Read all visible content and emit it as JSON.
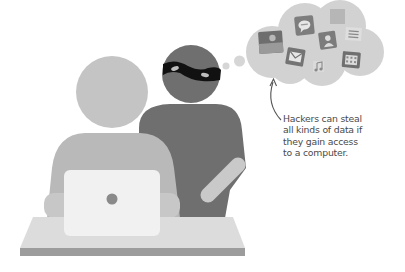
{
  "illustration": {
    "subject": "Hacker looking over shoulder of a laptop user",
    "colors": {
      "background": "#ffffff",
      "user_head": "#c4c4c4",
      "user_body": "#b9b9b9",
      "user_arms": "#c7c7c7",
      "hacker": "#6f6f6f",
      "hacker_arm": "#c9c9c9",
      "mask": "#111111",
      "mask_eyes": "#bdbdbd",
      "laptop": "#f1f1f1",
      "laptop_logo": "#8a8a8a",
      "desk_top": "#dcdcdc",
      "desk_edge": "#9c9c9c",
      "cloud": "#d2d2d2",
      "thought_bubble": "#d6d6d6",
      "icon_dark": "#7a7a7a",
      "icon_light": "#e4e4e4",
      "arrow": "#555555"
    },
    "thought_cloud": {
      "icons": [
        {
          "name": "photo-icon"
        },
        {
          "name": "chat-icon"
        },
        {
          "name": "gallery-icon"
        },
        {
          "name": "mail-icon"
        },
        {
          "name": "contact-icon"
        },
        {
          "name": "notes-icon"
        },
        {
          "name": "music-icon"
        },
        {
          "name": "calendar-icon"
        }
      ]
    }
  },
  "caption": {
    "lines": [
      "Hackers can steal",
      "all kinds of data if",
      "they gain access",
      "to a computer."
    ]
  }
}
